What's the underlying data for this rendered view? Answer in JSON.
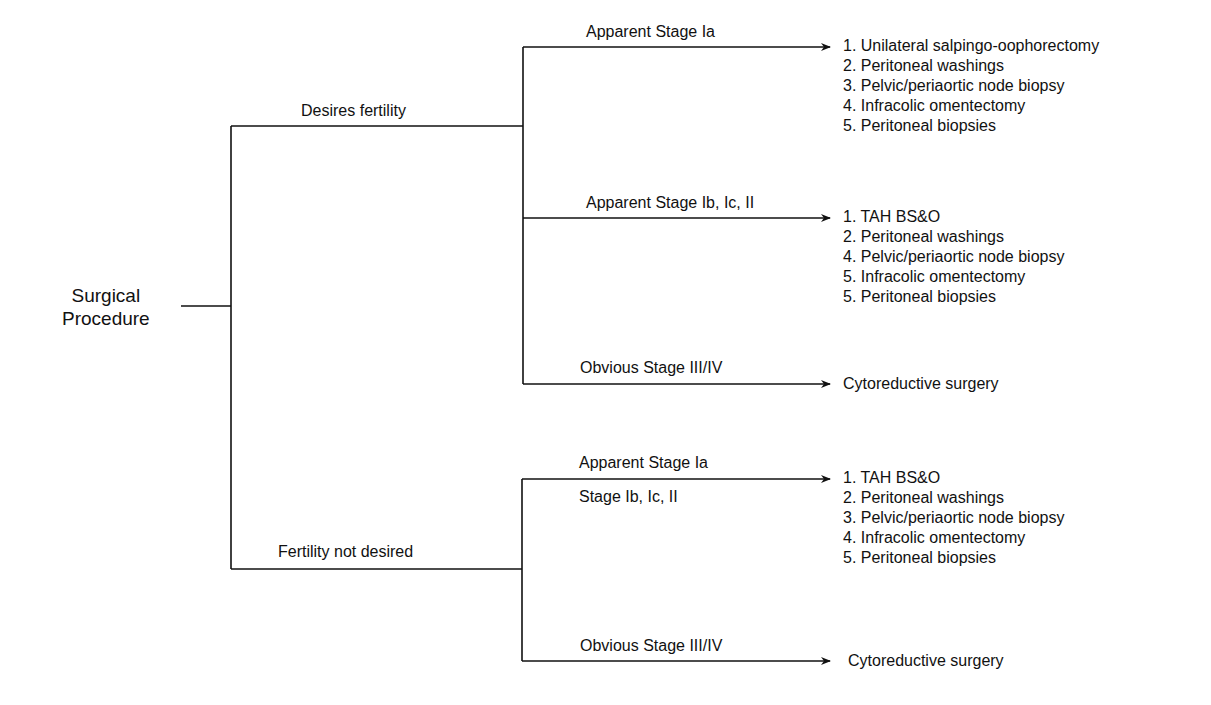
{
  "diagram": {
    "root": {
      "label_line1": "Surgical",
      "label_line2": "Procedure"
    },
    "branches": [
      {
        "label": "Desires fertility",
        "sub": [
          {
            "label": "Apparent Stage Ia",
            "outcome": [
              "1. Unilateral salpingo-oophorectomy",
              "2. Peritoneal washings",
              "3. Pelvic/periaortic node biopsy",
              "4. Infracolic omentectomy",
              "5. Peritoneal biopsies"
            ]
          },
          {
            "label": "Apparent Stage Ib, Ic, II",
            "outcome": [
              "1. TAH BS&O",
              "2. Peritoneal washings",
              "4. Pelvic/periaortic node biopsy",
              "5. Infracolic omentectomy",
              "5. Peritoneal biopsies"
            ]
          },
          {
            "label": "Obvious Stage III/IV",
            "outcome": [
              "Cytoreductive surgery"
            ]
          }
        ]
      },
      {
        "label": "Fertility not desired",
        "sub": [
          {
            "label": "Apparent Stage Ia",
            "label2": "Stage Ib, Ic, II",
            "outcome": [
              "1. TAH BS&O",
              "2. Peritoneal washings",
              "3. Pelvic/periaortic node biopsy",
              "4. Infracolic omentectomy",
              "5. Peritoneal biopsies"
            ]
          },
          {
            "label": "Obvious Stage III/IV",
            "outcome": [
              "Cytoreductive surgery"
            ]
          }
        ]
      }
    ]
  }
}
